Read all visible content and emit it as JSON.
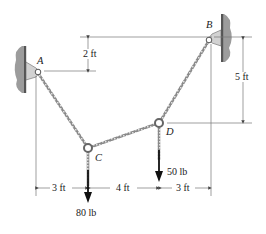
{
  "diagram": {
    "type": "cable-system-statics",
    "points": {
      "A": {
        "label": "A"
      },
      "B": {
        "label": "B"
      },
      "C": {
        "label": "C"
      },
      "D": {
        "label": "D"
      }
    },
    "loads": {
      "C": {
        "label": "80 lb",
        "value": 80,
        "unit": "lb"
      },
      "D": {
        "label": "50 lb",
        "value": 50,
        "unit": "lb"
      }
    },
    "dimensions": {
      "vertical_A_B": {
        "label": "2 ft",
        "value": 2
      },
      "vertical_B_D": {
        "label": "5 ft",
        "value": 5
      },
      "horizontal_A_C": {
        "label": "3 ft",
        "value": 3
      },
      "horizontal_C_D": {
        "label": "4 ft",
        "value": 4
      },
      "horizontal_D_B": {
        "label": "3 ft",
        "value": 3
      }
    },
    "colors": {
      "line": "#555555",
      "cable": "#6a6a6a",
      "wall": "#b0b0b0",
      "bracket": "#d4d4d4",
      "arrow": "#111111"
    }
  }
}
